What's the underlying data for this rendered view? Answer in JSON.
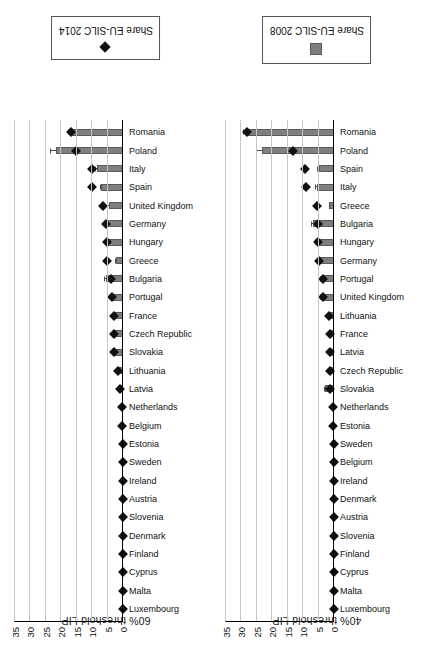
{
  "figure": {
    "panels": [
      {
        "id": "panel-60",
        "title": "60% threshold LIP",
        "legend_label": "Share EU-SILC 2014",
        "legend_marker": "diamond-marker-icon"
      },
      {
        "id": "panel-40",
        "title": "40% threshold LIP",
        "legend_label": "Share EU-SILC 2008",
        "legend_marker": "bar-swatch-icon"
      }
    ],
    "axis": {
      "ticks": [
        "0",
        "5",
        "10",
        "15",
        "20",
        "25",
        "30",
        "35"
      ],
      "min": 0,
      "max": 35
    },
    "colors": {
      "bar": "#7f7f7f",
      "bar_edge": "#5a5a5a",
      "marker": "#111111",
      "gridline": "#c4c4c4",
      "axis": "#000000",
      "background": "#ffffff"
    }
  },
  "chart_data": [
    {
      "type": "bar",
      "title": "60% threshold LIP",
      "xlabel": "",
      "ylabel": "",
      "ylim": [
        0,
        35
      ],
      "yticks": [
        0,
        5,
        10,
        15,
        20,
        25,
        30,
        35
      ],
      "grid": true,
      "legend_position": "right",
      "categories": [
        "Luxembourg",
        "Malta",
        "Cyprus",
        "Finland",
        "Denmark",
        "Slovenia",
        "Austria",
        "Ireland",
        "Sweden",
        "Estonia",
        "Belgium",
        "Netherlands",
        "Latvia",
        "Lithuania",
        "Slovakia",
        "Czech Republic",
        "France",
        "Portugal",
        "Bulgaria",
        "Greece",
        "Hungary",
        "Germany",
        "United Kingdom",
        "Spain",
        "Italy",
        "Poland",
        "Romania"
      ],
      "series": [
        {
          "name": "Share EU-SILC 2008",
          "type": "bar",
          "values": [
            0.05,
            0.05,
            0.05,
            0.05,
            0.05,
            0.05,
            0.05,
            0.05,
            0.05,
            0.1,
            0.1,
            0.1,
            0.9,
            1.6,
            2.6,
            2.6,
            2.7,
            3.1,
            5.6,
            2.2,
            5.3,
            5.3,
            4.6,
            7.1,
            8.5,
            21.7,
            17.0
          ],
          "errors": [
            0,
            0,
            0,
            0,
            0,
            0,
            0,
            0,
            0,
            0,
            0,
            0,
            0.3,
            0.4,
            0.6,
            0.4,
            0.4,
            0.4,
            0.7,
            0.4,
            0.8,
            0.6,
            0.8,
            0.5,
            0.6,
            2.0,
            0.8
          ]
        },
        {
          "name": "Share EU-SILC 2014",
          "type": "scatter",
          "values": [
            0.05,
            0.05,
            0.05,
            0.05,
            0.05,
            0.05,
            0.05,
            0.05,
            0.05,
            0.1,
            0.2,
            0.2,
            1.1,
            1.7,
            2.9,
            2.9,
            2.9,
            3.7,
            3.9,
            5.2,
            5.3,
            5.4,
            6.6,
            10.2,
            10.2,
            15.3,
            16.9
          ]
        }
      ]
    },
    {
      "type": "bar",
      "title": "40% threshold LIP",
      "xlabel": "",
      "ylabel": "",
      "ylim": [
        0,
        35
      ],
      "yticks": [
        0,
        5,
        10,
        15,
        20,
        25,
        30,
        35
      ],
      "grid": true,
      "legend_position": "right",
      "categories": [
        "Luxembourg",
        "Malta",
        "Cyprus",
        "Finland",
        "Slovenia",
        "Austria",
        "Denmark",
        "Ireland",
        "Belgium",
        "Sweden",
        "Estonia",
        "Netherlands",
        "Slovakia",
        "Czech Republic",
        "Latvia",
        "France",
        "Lithuania",
        "United Kingdom",
        "Portugal",
        "Germany",
        "Hungary",
        "Bulgaria",
        "Greece",
        "Italy",
        "Spain",
        "Poland",
        "Romania"
      ],
      "series": [
        {
          "name": "Share EU-SILC 2008",
          "type": "bar",
          "values": [
            0.05,
            0.05,
            0.05,
            0.05,
            0.05,
            0.05,
            0.05,
            0.05,
            0.05,
            0.1,
            0.1,
            0.1,
            2.9,
            1.2,
            1.2,
            1.2,
            1.5,
            4.0,
            4.0,
            4.5,
            5.5,
            6.8,
            1.5,
            5.5,
            5.0,
            23.2,
            28.0
          ],
          "errors": [
            0,
            0,
            0,
            0,
            0,
            0,
            0,
            0,
            0,
            0,
            0,
            0,
            0.6,
            0.3,
            0.3,
            0.3,
            0.3,
            0.5,
            0.5,
            0.5,
            0.7,
            0.8,
            0.3,
            0.7,
            0.5,
            2.0,
            1.6
          ]
        },
        {
          "name": "Share EU-SILC 2014",
          "type": "scatter",
          "values": [
            0.05,
            0.05,
            0.05,
            0.05,
            0.05,
            0.05,
            0.05,
            0.05,
            0.05,
            0.1,
            0.2,
            0.2,
            1.3,
            1.3,
            1.4,
            1.4,
            1.7,
            3.6,
            3.6,
            5.0,
            5.1,
            5.3,
            5.4,
            9.0,
            9.4,
            13.2,
            28.2
          ]
        }
      ]
    }
  ]
}
